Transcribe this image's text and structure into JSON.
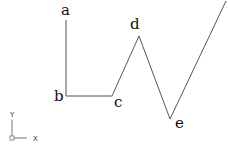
{
  "diagram": {
    "background": "#ffffff",
    "line_color": "#555555",
    "polyline": {
      "points": [
        {
          "id": "a",
          "label": "a",
          "x": 66,
          "y": 20,
          "label_x": 61,
          "label_y": 15
        },
        {
          "id": "b",
          "label": "b",
          "x": 66,
          "y": 96,
          "label_x": 54,
          "label_y": 101
        },
        {
          "id": "c",
          "label": "c",
          "x": 112,
          "y": 96,
          "label_x": 114,
          "label_y": 107
        },
        {
          "id": "d",
          "label": "d",
          "x": 139,
          "y": 36,
          "label_x": 130,
          "label_y": 29
        },
        {
          "id": "e",
          "label": "e",
          "x": 170,
          "y": 119,
          "label_x": 175,
          "label_y": 128
        },
        {
          "id": "end",
          "label": "",
          "x": 226,
          "y": 1
        }
      ]
    },
    "ucs_icon": {
      "y_label": "Y",
      "x_label": "X",
      "origin_x": 12,
      "origin_y": 138
    }
  }
}
